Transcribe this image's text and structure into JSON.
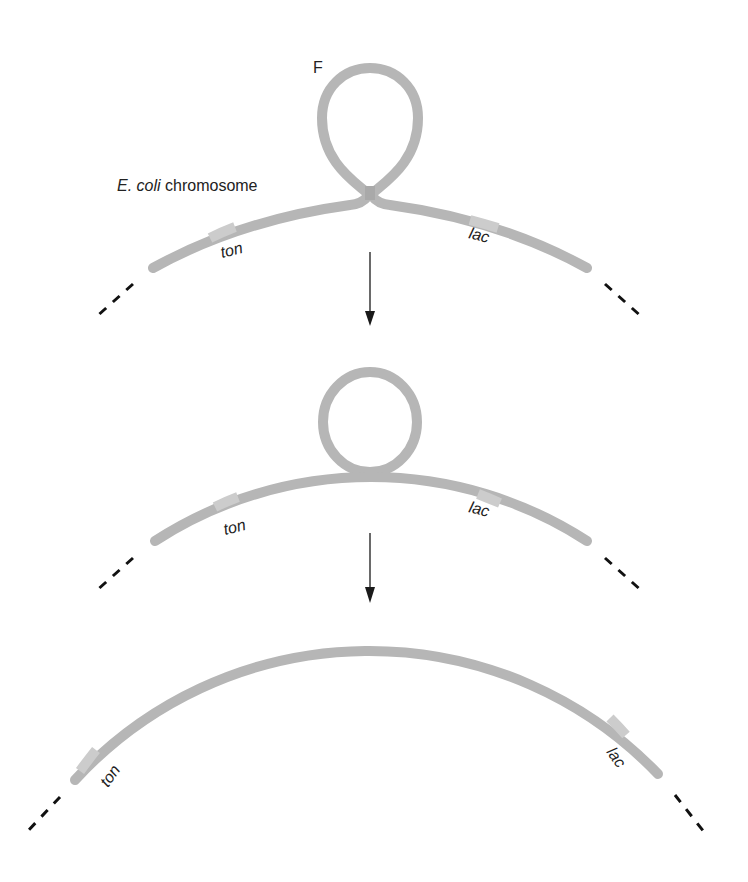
{
  "figure": {
    "colors": {
      "dna": "#b6b6b6",
      "dna_band": "#cccccc",
      "dna_dark_band": "#a8a8a8",
      "ink": "#1a1a1a"
    },
    "step1": {
      "plasmid_label": "F",
      "chromosome_label_italic": "E. coli",
      "chromosome_label_rest": " chromosome",
      "gene_left": "ton",
      "gene_right": "lac"
    },
    "step2": {
      "gene_left": "ton",
      "gene_right": "lac"
    },
    "step3": {
      "gene_left": "ton",
      "gene_right": "lac"
    },
    "arrows": [
      {
        "from": "step1",
        "to": "step2",
        "direction": "down"
      },
      {
        "from": "step2",
        "to": "step3",
        "direction": "down"
      }
    ]
  }
}
